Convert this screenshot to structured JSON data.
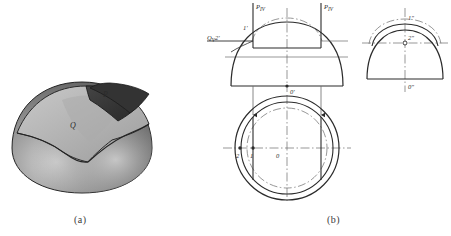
{
  "figure": {
    "title_a": "(a)",
    "title_b": "(b)",
    "pictorial": {
      "label_p": "P",
      "label_q": "Q",
      "surface_dark": "#3b3b3b",
      "surface_light": "#b9b9b9",
      "surface_body": "#8a8a8a",
      "outline": "#2a2a2a"
    },
    "projection": {
      "front_view": {
        "trace_left": "P",
        "trace_left_sub": "IV",
        "trace_right": "P",
        "trace_right_sub": "IV",
        "plane_q": "Q",
        "plane_q_sub": "V",
        "point_2_prime": "2'",
        "point_1_prime": "1'",
        "point_1_prime_left": "1'",
        "center": "0'"
      },
      "side_view": {
        "point_1": "1″",
        "point_2": "2″",
        "center": "0″"
      },
      "top_view": {
        "point_2": "2",
        "point_1": "1",
        "center": "0"
      }
    },
    "colors": {
      "line": "#2b2b2b",
      "thin_line": "#555555",
      "center_line": "#6a6a6a",
      "text": "#2b2b2b"
    }
  }
}
